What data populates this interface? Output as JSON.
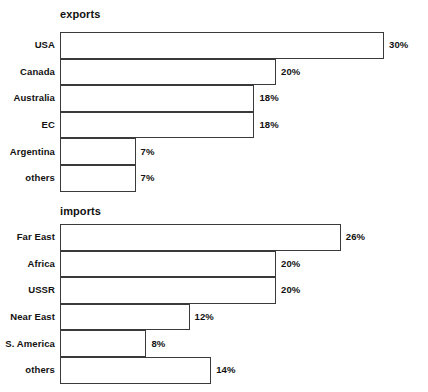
{
  "page": {
    "background_color": "#ffffff",
    "bar_fill_color": "#ffffff",
    "bar_border_color": "#3a3a3a",
    "text_color": "#111111"
  },
  "chart_data": [
    {
      "type": "bar",
      "orientation": "horizontal",
      "title": "exports",
      "xlabel": "",
      "ylabel": "",
      "grid": false,
      "legend": "none",
      "xlim": [
        0,
        30
      ],
      "unit": "%",
      "categories": [
        "USA",
        "Canada",
        "Australia",
        "EC",
        "Argentina",
        "others"
      ],
      "values": [
        30,
        20,
        18,
        18,
        7,
        7
      ],
      "value_labels": [
        "30%",
        "20%",
        "18%",
        "18%",
        "7%",
        "7%"
      ]
    },
    {
      "type": "bar",
      "orientation": "horizontal",
      "title": "imports",
      "xlabel": "",
      "ylabel": "",
      "grid": false,
      "legend": "none",
      "xlim": [
        0,
        26
      ],
      "unit": "%",
      "categories": [
        "Far East",
        "Africa",
        "USSR",
        "Near East",
        "S. America",
        "others"
      ],
      "values": [
        26,
        20,
        20,
        12,
        8,
        14
      ],
      "value_labels": [
        "26%",
        "20%",
        "20%",
        "12%",
        "8%",
        "14%"
      ]
    }
  ]
}
